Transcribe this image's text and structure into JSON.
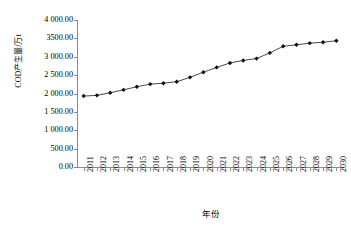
{
  "figure": {
    "top_cropped_text": "",
    "background_color": "#ffffff",
    "line_color": "#1a1a1a",
    "marker_color": "#111111",
    "axis_color": "#8a8a8a"
  },
  "axes": {
    "y_title": "COD产生量/万t",
    "x_title": "年份",
    "y_tick_labels": [
      "4 000.00",
      "3500.00",
      "3 000.00",
      "2 500.00",
      "2 000.00",
      "1 500.00",
      "1 000.00",
      "500.00",
      "0.00"
    ],
    "y_tick_values": [
      4000,
      3500,
      3000,
      2500,
      2000,
      1500,
      1000,
      500,
      0
    ]
  },
  "chart_data": {
    "type": "line",
    "title": "",
    "xlabel": "年份",
    "ylabel": "COD产生量/万t",
    "categories": [
      "2011",
      "2012",
      "2013",
      "2014",
      "2015",
      "2016",
      "2017",
      "2018",
      "2019",
      "2020",
      "2021",
      "2022",
      "2023",
      "2024",
      "2025",
      "2026",
      "2027",
      "2028",
      "2029",
      "2030"
    ],
    "values": [
      1930,
      1950,
      2020,
      2100,
      2185,
      2255,
      2280,
      2320,
      2440,
      2580,
      2710,
      2830,
      2900,
      2950,
      3105,
      3285,
      3325,
      3370,
      3395,
      3435
    ],
    "series": [
      {
        "name": "COD产生量",
        "values": [
          1930,
          1950,
          2020,
          2100,
          2185,
          2255,
          2280,
          2320,
          2440,
          2580,
          2710,
          2830,
          2900,
          2950,
          3105,
          3285,
          3325,
          3370,
          3395,
          3435
        ]
      }
    ],
    "ylim": [
      0,
      4000
    ],
    "ytick_step": 500,
    "grid": false,
    "legend": false,
    "marker": "diamond"
  }
}
